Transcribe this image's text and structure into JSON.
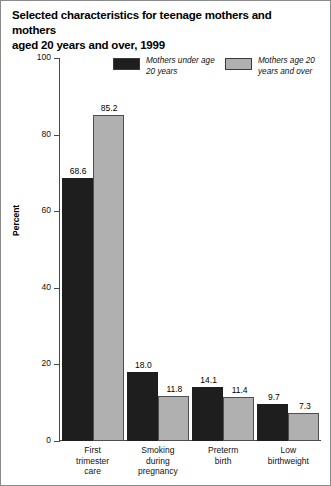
{
  "chart_data": {
    "type": "bar",
    "title": "Selected characteristics for teenage mothers and mothers aged 20 years and over, 1999",
    "title_line1": "Selected characteristics for teenage mothers and mothers",
    "title_line2": "aged 20 years and over, 1999",
    "xlabel": "",
    "ylabel": "Percent",
    "ylim": [
      0,
      100
    ],
    "ytick_labels": [
      "100",
      "80",
      "60",
      "40",
      "20",
      "0"
    ],
    "ytick_values": [
      100,
      80,
      60,
      40,
      20,
      0
    ],
    "grid": false,
    "legend_position": "top-center",
    "categories": [
      "First trimester care",
      "Smoking during pregnancy",
      "Preterm birth",
      "Low birthweight"
    ],
    "category_lines": [
      [
        "First",
        "trimester",
        "care"
      ],
      [
        "Smoking",
        "during",
        "pregnancy"
      ],
      [
        "Preterm",
        "birth"
      ],
      [
        "Low",
        "birthweight"
      ]
    ],
    "series": [
      {
        "name": "Mothers under age 20 years",
        "name_line1": "Mothers under age",
        "name_line2": "20 years",
        "color": "#1e1e1e",
        "values": [
          68.6,
          18.0,
          14.1,
          9.7
        ],
        "labels": [
          "68.6",
          "18.0",
          "14.1",
          "9.7"
        ]
      },
      {
        "name": "Mothers age 20 years and over",
        "name_line1": "Mothers age 20",
        "name_line2": "years and over",
        "color": "#b0b0b0",
        "values": [
          85.2,
          11.8,
          11.4,
          7.3
        ],
        "labels": [
          "85.2",
          "11.8",
          "11.4",
          "7.3"
        ]
      }
    ]
  }
}
